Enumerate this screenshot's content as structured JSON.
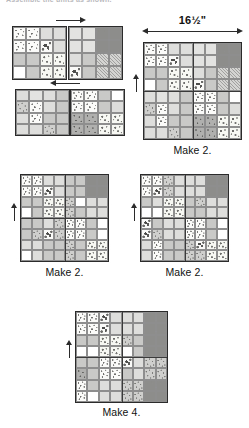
{
  "page": {
    "top_cut_text": "Assemble the units as shown.",
    "background_color": "#ffffff",
    "line_color": "#2b2b2b"
  },
  "palette": {
    "white": "#ffffff",
    "cream": "#f4f2ee",
    "light_gray": "#e3e3e1",
    "medium_gray": "#c9c9c7",
    "dark_gray": "#9e9e9c",
    "darkest_gray": "#8d8d8b",
    "outline": "#2b2b2b"
  },
  "dimension": {
    "label": "16½\"",
    "orientation": "horizontal",
    "applies_to": "block-main"
  },
  "arrows": [
    {
      "name": "arrow-right-unit-a",
      "direction": "right"
    },
    {
      "name": "arrow-left-unit-b",
      "direction": "left"
    },
    {
      "name": "grainline-main",
      "direction": "up"
    },
    {
      "name": "grainline-left",
      "direction": "up"
    },
    {
      "name": "grainline-right",
      "direction": "up"
    },
    {
      "name": "grainline-bottom",
      "direction": "up"
    }
  ],
  "blocks": [
    {
      "id": "unit-top-left",
      "caption": "",
      "units": [
        "floral",
        "floral",
        "hatch",
        "hatch",
        "floral",
        "floral",
        "leaf",
        "hatch",
        "med",
        "med",
        "floral2",
        "floral2",
        "white",
        "med",
        "floral2",
        "floral2"
      ]
    },
    {
      "id": "unit-top-right",
      "caption": "",
      "units": [
        "lt",
        "lt",
        "dkr",
        "dkr",
        "lt",
        "lt",
        "dkr",
        "dkr",
        "hatch",
        "med",
        "diag",
        "diag",
        "leaf",
        "med",
        "diag",
        "diag"
      ]
    },
    {
      "id": "unit-bottom-strip-left",
      "caption": "",
      "units": [
        "hatch",
        "lt",
        "hatch",
        "med",
        "spec",
        "floral",
        "hatch",
        "med",
        "hatch",
        "floral",
        "med",
        "med",
        "hatch",
        "hatch",
        "spec",
        "med"
      ]
    },
    {
      "id": "unit-bottom-strip-right",
      "caption": "",
      "units": [
        "floral",
        "floral",
        "med",
        "white",
        "floral",
        "floral",
        "med",
        "hatch",
        "spec-d",
        "spec-d",
        "floral2",
        "floral2",
        "spec-d",
        "spec-d",
        "floral2",
        "floral2"
      ]
    },
    {
      "id": "block-main",
      "caption": "Make 2.",
      "units": [
        "floral",
        "floral",
        "hatch",
        "hatch",
        "lt",
        "lt",
        "dkr",
        "dkr",
        "floral",
        "floral",
        "leaf",
        "hatch",
        "lt",
        "lt",
        "dkr",
        "dkr",
        "med",
        "med",
        "floral2",
        "floral2",
        "hatch",
        "med",
        "diag",
        "diag",
        "white",
        "med",
        "floral2",
        "floral2",
        "leaf",
        "med",
        "diag",
        "diag",
        "hatch",
        "lt",
        "hatch",
        "med",
        "floral",
        "floral",
        "med",
        "white",
        "spec",
        "floral",
        "hatch",
        "med",
        "floral",
        "floral",
        "med",
        "hatch",
        "hatch",
        "floral",
        "med",
        "med",
        "spec-d",
        "spec-d",
        "floral2",
        "floral2",
        "hatch",
        "hatch",
        "spec",
        "med",
        "spec-d",
        "spec-d",
        "floral2",
        "floral2"
      ]
    },
    {
      "id": "block-left-mid",
      "caption": "Make 2.",
      "units": [
        "floral",
        "floral",
        "hatch",
        "hatch",
        "med",
        "med",
        "dkr",
        "dkr",
        "floral",
        "floral",
        "leaf",
        "hatch",
        "med",
        "med",
        "dkr",
        "dkr",
        "med",
        "med",
        "floral2",
        "floral2",
        "spec",
        "white",
        "hatch",
        "hatch",
        "white",
        "med",
        "floral2",
        "floral2",
        "spec",
        "med",
        "hatch",
        "hatch",
        "med",
        "med",
        "hatch",
        "spec",
        "floral",
        "floral",
        "med",
        "white",
        "med",
        "spec",
        "leaf",
        "spec",
        "floral",
        "floral",
        "med",
        "white",
        "hatch",
        "hatch",
        "med",
        "med",
        "spec",
        "med",
        "floral2",
        "floral2",
        "white",
        "hatch",
        "med",
        "med",
        "spec",
        "med",
        "floral2",
        "floral2"
      ]
    },
    {
      "id": "block-right-mid",
      "caption": "Make 2.",
      "units": [
        "floral",
        "floral",
        "spec",
        "hatch",
        "hatch",
        "hatch",
        "dkr",
        "dkr",
        "floral",
        "leaf",
        "spec",
        "hatch",
        "hatch",
        "hatch",
        "dkr",
        "dkr",
        "med",
        "hatch",
        "floral2",
        "floral2",
        "med",
        "spec",
        "hatch",
        "hatch",
        "white",
        "white",
        "floral2",
        "floral2",
        "med",
        "med",
        "hatch",
        "hatch",
        "leaf",
        "med",
        "hatch",
        "hatch",
        "floral",
        "floral",
        "med",
        "white",
        "leaf",
        "spec",
        "hatch",
        "hatch",
        "floral",
        "floral",
        "med",
        "white",
        "hatch",
        "floral",
        "med",
        "med",
        "spec",
        "leaf",
        "floral2",
        "floral2",
        "hatch",
        "floral",
        "med",
        "med",
        "spec",
        "spec",
        "floral2",
        "floral2"
      ]
    },
    {
      "id": "block-bottom",
      "caption": "Make 4.",
      "units": [
        "floral",
        "floral",
        "leaf",
        "hatch",
        "hatch",
        "hatch",
        "dkr",
        "dkr",
        "floral",
        "floral",
        "leaf",
        "hatch",
        "hatch",
        "hatch",
        "dkr",
        "dkr",
        "med",
        "med",
        "floral2",
        "floral2",
        "spec",
        "med",
        "dkr",
        "dkr",
        "white",
        "white",
        "floral2",
        "floral2",
        "white",
        "med",
        "dkr",
        "dkr",
        "med",
        "med",
        "floral",
        "floral",
        "leaf",
        "hatch",
        "spec",
        "spec",
        "spec-d",
        "med",
        "floral",
        "floral",
        "med",
        "hatch",
        "spec",
        "spec",
        "floral",
        "med",
        "hatch",
        "hatch",
        "spec",
        "spec",
        "dkr",
        "dkr",
        "floral",
        "white",
        "hatch",
        "hatch",
        "spec",
        "spec",
        "dkr",
        "dkr"
      ]
    }
  ]
}
